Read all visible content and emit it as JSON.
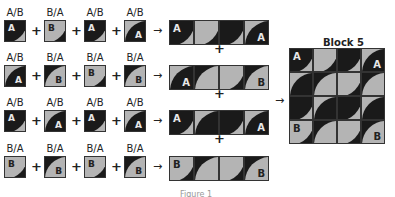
{
  "colors": {
    "dark": "#1a1a1a",
    "light": "#b4b4b4"
  },
  "symbols": {
    "plus": "+",
    "arrow": "→"
  },
  "rows": [
    {
      "labels": [
        "A/B",
        "B/A",
        "A/B",
        "A/B"
      ],
      "tiles": [
        {
          "bg": "light",
          "fill": "dark",
          "corner": "tl",
          "text": "A",
          "textColor": "light",
          "textPos": "tl"
        },
        {
          "bg": "dark",
          "fill": "light",
          "corner": "tl",
          "text": "B",
          "textColor": "dark",
          "textPos": "tl"
        },
        {
          "bg": "light",
          "fill": "dark",
          "corner": "tl",
          "text": "A",
          "textColor": "light",
          "textPos": "tl"
        },
        {
          "bg": "light",
          "fill": "dark",
          "corner": "br",
          "text": "A",
          "textColor": "light",
          "textPos": "br"
        }
      ]
    },
    {
      "labels": [
        "A/B",
        "B/A",
        "B/A",
        "B/A"
      ],
      "tiles": [
        {
          "bg": "light",
          "fill": "dark",
          "corner": "br",
          "text": "A",
          "textColor": "light",
          "textPos": "br"
        },
        {
          "bg": "dark",
          "fill": "light",
          "corner": "br",
          "text": "B",
          "textColor": "dark",
          "textPos": "br"
        },
        {
          "bg": "dark",
          "fill": "light",
          "corner": "tl",
          "text": "B",
          "textColor": "dark",
          "textPos": "tl"
        },
        {
          "bg": "dark",
          "fill": "light",
          "corner": "br",
          "text": "B",
          "textColor": "dark",
          "textPos": "br"
        }
      ]
    },
    {
      "labels": [
        "A/B",
        "A/B",
        "A/B",
        "A/B"
      ],
      "tiles": [
        {
          "bg": "light",
          "fill": "dark",
          "corner": "tl",
          "text": "A",
          "textColor": "light",
          "textPos": "tl"
        },
        {
          "bg": "light",
          "fill": "dark",
          "corner": "br",
          "text": "A",
          "textColor": "light",
          "textPos": "br"
        },
        {
          "bg": "light",
          "fill": "dark",
          "corner": "tl",
          "text": "A",
          "textColor": "light",
          "textPos": "tl"
        },
        {
          "bg": "light",
          "fill": "dark",
          "corner": "br",
          "text": "A",
          "textColor": "light",
          "textPos": "br"
        }
      ]
    },
    {
      "labels": [
        "B/A",
        "B/A",
        "B/A",
        "B/A"
      ],
      "tiles": [
        {
          "bg": "dark",
          "fill": "light",
          "corner": "tl",
          "text": "B",
          "textColor": "dark",
          "textPos": "tl"
        },
        {
          "bg": "dark",
          "fill": "light",
          "corner": "br",
          "text": "B",
          "textColor": "dark",
          "textPos": "br"
        },
        {
          "bg": "dark",
          "fill": "light",
          "corner": "tl",
          "text": "B",
          "textColor": "dark",
          "textPos": "tl"
        },
        {
          "bg": "dark",
          "fill": "light",
          "corner": "br",
          "text": "B",
          "textColor": "dark",
          "textPos": "br"
        }
      ]
    }
  ],
  "block": {
    "title": "Block 5",
    "corner_labels": {
      "tl": "A",
      "tr": "A",
      "bl": "B",
      "br": "B"
    }
  },
  "caption": "Figure 1"
}
